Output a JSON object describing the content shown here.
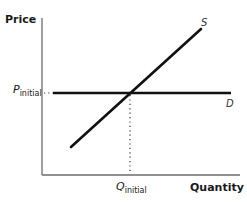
{
  "diagram": {
    "type": "supply-demand",
    "axes": {
      "y_label": "Price",
      "x_label": "Quantity"
    },
    "curves": [
      {
        "id": "supply",
        "label": "S",
        "shape": "upward-sloping line"
      },
      {
        "id": "demand",
        "label": "D",
        "shape": "horizontal line (perfectly elastic)"
      }
    ],
    "equilibrium": {
      "price_label": {
        "symbol": "P",
        "subscript": "initial"
      },
      "quantity_label": {
        "symbol": "Q",
        "subscript": "initial"
      }
    },
    "colors": {
      "curve": "#111111",
      "axis": "#666666",
      "guide": "#333333"
    }
  }
}
